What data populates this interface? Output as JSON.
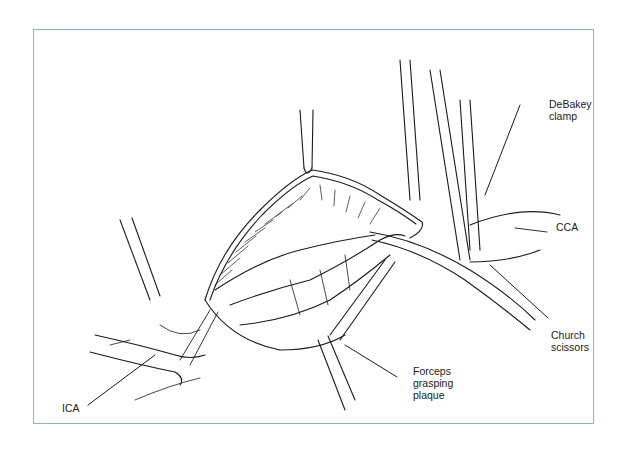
{
  "figure": {
    "frame_color": "#8fb3b8",
    "line_color": "#1a1a1a",
    "labels": [
      {
        "id": "debakey",
        "text": "DeBakey\nclamp"
      },
      {
        "id": "cca",
        "text": "CCA"
      },
      {
        "id": "church",
        "text": "Church\nscissors"
      },
      {
        "id": "forceps",
        "text": "Forceps\ngrasping\nplaque"
      },
      {
        "id": "ica",
        "text": "ICA"
      }
    ]
  }
}
